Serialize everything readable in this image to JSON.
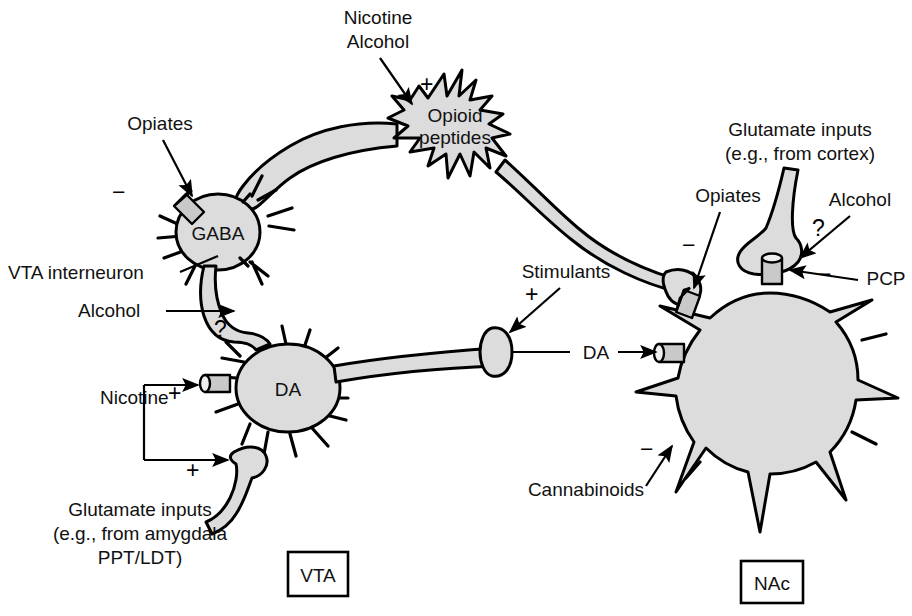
{
  "figure": {
    "type": "neuroscience-schematic",
    "background_color": "#ffffff",
    "soma_fill": "#dcdcdc",
    "outline_color": "#000000"
  },
  "cells": [
    {
      "id": "opioid",
      "label_line1": "Opioid",
      "label_line2": "peptides"
    },
    {
      "id": "gaba",
      "label": "GABA"
    },
    {
      "id": "da",
      "label": "DA"
    },
    {
      "id": "nac",
      "label": ""
    }
  ],
  "regions": [
    {
      "id": "vta",
      "label": "VTA"
    },
    {
      "id": "nac",
      "label": "NAc"
    }
  ],
  "drug_labels": [
    {
      "id": "nicotine-top",
      "text": "Nicotine",
      "sign": "+",
      "target": "opioid-peptide-neuron"
    },
    {
      "id": "alcohol-top",
      "text": "Alcohol",
      "sign": "+",
      "target": "opioid-peptide-neuron"
    },
    {
      "id": "opiates-gaba",
      "text": "Opiates",
      "sign": "−",
      "target": "gaba-interneuron-receptor"
    },
    {
      "id": "alcohol-gaba-terminal",
      "text": "Alcohol",
      "sign": "?",
      "target": "gaba-terminal-on-da"
    },
    {
      "id": "nicotine-da",
      "text": "Nicotine",
      "sign": "+",
      "target": "da-neuron-receptor"
    },
    {
      "id": "nicotine-glutamate-terminal",
      "text": "",
      "sign": "+",
      "target": "glutamate-terminal-on-da"
    },
    {
      "id": "stimulants",
      "text": "Stimulants",
      "sign": "+",
      "target": "da-terminal-in-nac"
    },
    {
      "id": "opiates-nac",
      "text": "Opiates",
      "sign": "−",
      "target": "opioid-terminal-on-nac"
    },
    {
      "id": "alcohol-nac",
      "text": "Alcohol",
      "sign": "?",
      "target": "glutamate-terminal-on-nac"
    },
    {
      "id": "pcp-nac",
      "text": "PCP",
      "sign": "−",
      "target": "glutamate-receptor-on-nac"
    },
    {
      "id": "cannabinoids",
      "text": "Cannabinoids",
      "sign": "−",
      "target": "nac-neuron"
    }
  ],
  "annotations": {
    "vta_interneuron": "VTA interneuron",
    "glutamate_inputs_cortex_line1": "Glutamate inputs",
    "glutamate_inputs_cortex_line2": "(e.g., from cortex)",
    "glutamate_inputs_amygdala_line1": "Glutamate inputs",
    "glutamate_inputs_amygdala_line2": "(e.g., from amygdala",
    "glutamate_inputs_amygdala_line3": "PPT/LDT)",
    "da_transmission": "DA"
  },
  "signs": {
    "plus": "+",
    "minus": "−",
    "question": "?"
  }
}
